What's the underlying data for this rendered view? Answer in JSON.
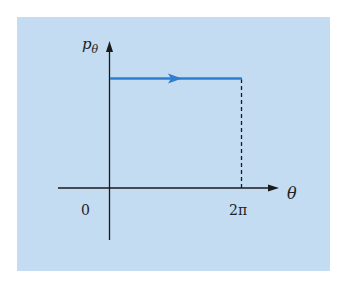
{
  "diagram": {
    "background_color": "#c3dcf1",
    "trajectory_color": "#2e7fd1",
    "axis_color": "#1a1a1a",
    "y_axis_label": "p",
    "y_axis_label_subscript": "θ",
    "x_axis_label": "θ",
    "x_ticks": [
      {
        "label": "0"
      },
      {
        "label": "2π"
      }
    ],
    "trajectory": {
      "description": "horizontal line at constant p_theta from theta = 0 to 2pi with right-pointing arrow",
      "style": "solid",
      "direction": "right"
    },
    "guide_line": {
      "description": "dashed vertical line from trajectory end down to theta = 2pi",
      "style": "dashed"
    }
  }
}
